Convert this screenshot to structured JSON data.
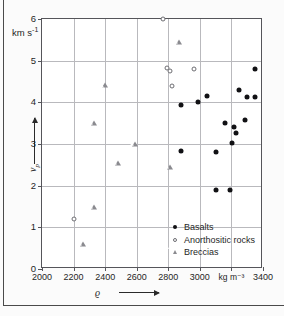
{
  "chart_data": {
    "type": "scatter",
    "title": "",
    "xlabel": "ϱ",
    "ylabel": "v_p",
    "x_unit": "kg m⁻³",
    "y_unit": "km s⁻¹",
    "xlim": [
      2000,
      3400
    ],
    "ylim": [
      0,
      6
    ],
    "xticks": [
      2000,
      2200,
      2400,
      2600,
      2800,
      3000,
      3200,
      3400
    ],
    "xticklabels": [
      "2000",
      "2200",
      "2400",
      "2600",
      "2800",
      "3000",
      "kg m⁻³",
      "3400"
    ],
    "yticks": [
      0,
      1,
      2,
      3,
      4,
      5,
      6
    ],
    "yticklabels": [
      "0",
      "1",
      "2",
      "3",
      "4",
      "5",
      "6"
    ],
    "grid": true,
    "legend_position": "lower-center",
    "series": [
      {
        "name": "Basalts",
        "marker": "filled-circle",
        "color": "#111114",
        "points": [
          [
            2880,
            3.93
          ],
          [
            2880,
            2.84
          ],
          [
            2990,
            4.02
          ],
          [
            3045,
            4.15
          ],
          [
            3100,
            2.8
          ],
          [
            3100,
            1.9
          ],
          [
            3160,
            3.51
          ],
          [
            3190,
            1.9
          ],
          [
            3205,
            3.03
          ],
          [
            3215,
            3.4
          ],
          [
            3230,
            3.27
          ],
          [
            3250,
            4.29
          ],
          [
            3285,
            3.58
          ],
          [
            3300,
            4.14
          ],
          [
            3350,
            4.14
          ],
          [
            3350,
            4.79
          ]
        ]
      },
      {
        "name": "Anorthositic rocks",
        "marker": "open-circle",
        "color": "#6d6d72",
        "points": [
          [
            2200,
            1.2
          ],
          [
            2765,
            6.0
          ],
          [
            2795,
            4.83
          ],
          [
            2810,
            4.76
          ],
          [
            2825,
            4.4
          ],
          [
            2965,
            4.79
          ]
        ]
      },
      {
        "name": "Breccias",
        "marker": "open-triangle",
        "color": "#8a8a8f",
        "points": [
          [
            2260,
            0.61
          ],
          [
            2330,
            1.5
          ],
          [
            2330,
            3.51
          ],
          [
            2400,
            4.41
          ],
          [
            2480,
            2.55
          ],
          [
            2590,
            3.0
          ],
          [
            2810,
            2.46
          ],
          [
            2870,
            5.45
          ]
        ]
      }
    ]
  },
  "axes": {
    "y_unit_main": "km s",
    "y_unit_exp": "-1",
    "y_symbol": "v",
    "y_symbol_sub": "p",
    "x_symbol": "ϱ"
  },
  "legend": {
    "items": [
      {
        "label": "Basalts",
        "marker": "filled-circle"
      },
      {
        "label": "Anorthositic rocks",
        "marker": "open-circle"
      },
      {
        "label": "Breccias",
        "marker": "open-triangle"
      }
    ]
  }
}
